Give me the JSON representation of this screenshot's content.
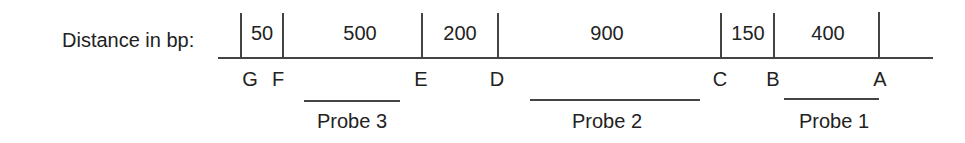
{
  "diagram": {
    "axis_label": "Distance in bp:",
    "segments": [
      {
        "value": "50",
        "from": "G",
        "to": "F"
      },
      {
        "value": "500",
        "from": "F",
        "to": "E"
      },
      {
        "value": "200",
        "from": "E",
        "to": "D"
      },
      {
        "value": "900",
        "from": "D",
        "to": "C"
      },
      {
        "value": "150",
        "from": "C",
        "to": "B"
      },
      {
        "value": "400",
        "from": "B",
        "to": "A"
      }
    ],
    "sites": [
      "G",
      "F",
      "E",
      "D",
      "C",
      "B",
      "A"
    ],
    "probes": [
      {
        "label": "Probe 3"
      },
      {
        "label": "Probe 2"
      },
      {
        "label": "Probe 1"
      }
    ]
  }
}
